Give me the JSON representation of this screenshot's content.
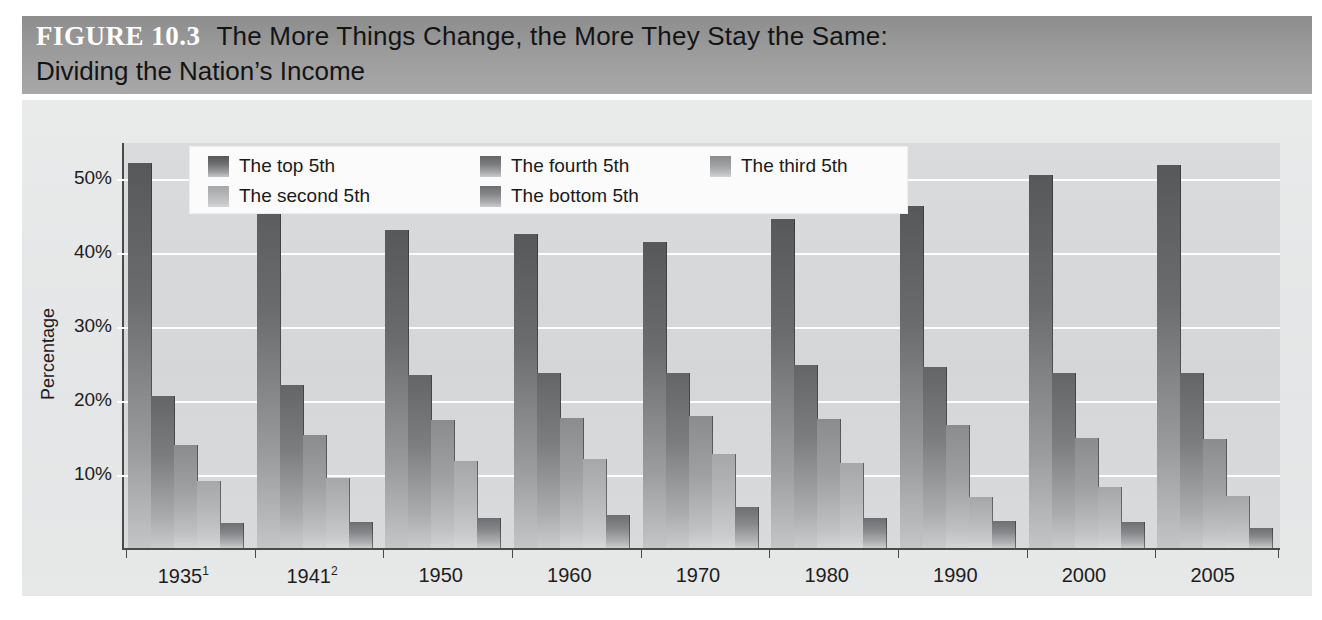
{
  "figure": {
    "number": "FIGURE 10.3",
    "title_line1": "The More Things Change, the More They Stay the Same:",
    "title_line2": "Dividing the Nation’s Income"
  },
  "chart_data": {
    "type": "bar",
    "title": "The More Things Change, the More They Stay the Same: Dividing the Nation’s Income",
    "xlabel": "",
    "ylabel": "Percentage",
    "ylim": [
      0,
      55
    ],
    "yticks": [
      10,
      20,
      30,
      40,
      50
    ],
    "ytick_labels": [
      "10%",
      "20%",
      "30%",
      "40%",
      "50%"
    ],
    "grid": true,
    "legend_position": "top-left-inside",
    "categories": [
      "1935",
      "1941",
      "1950",
      "1960",
      "1970",
      "1980",
      "1990",
      "2000",
      "2005"
    ],
    "category_labels": [
      "1935¹",
      "1941²",
      "1950",
      "1960",
      "1970",
      "1980",
      "1990",
      "2000",
      "2005"
    ],
    "category_footnotes": [
      "1",
      "2",
      "",
      "",
      "",
      "",
      "",
      "",
      ""
    ],
    "series": [
      {
        "name": "The top 5th",
        "values": [
          52.0,
          49.3,
          43.0,
          42.5,
          41.4,
          44.5,
          46.2,
          50.4,
          51.7
        ]
      },
      {
        "name": "The fourth 5th",
        "values": [
          20.5,
          22.0,
          23.4,
          23.6,
          23.6,
          24.7,
          24.4,
          23.6,
          23.7
        ]
      },
      {
        "name": "The third 5th",
        "values": [
          13.9,
          15.3,
          17.3,
          17.6,
          17.9,
          17.5,
          16.6,
          14.9,
          14.7
        ]
      },
      {
        "name": "The second 5th",
        "values": [
          9.0,
          9.5,
          11.8,
          12.0,
          12.7,
          11.5,
          6.9,
          8.3,
          7.0
        ]
      },
      {
        "name": "The bottom 5th",
        "values": [
          3.4,
          3.5,
          4.0,
          4.5,
          5.5,
          4.0,
          3.6,
          3.5,
          2.7
        ]
      }
    ]
  },
  "legend": {
    "items": [
      {
        "label": "The top 5th",
        "row": 0,
        "col": 0
      },
      {
        "label": "The fourth 5th",
        "row": 0,
        "col": 1
      },
      {
        "label": "The third 5th",
        "row": 0,
        "col": 2
      },
      {
        "label": "The second 5th",
        "row": 1,
        "col": 0
      },
      {
        "label": "The bottom 5th",
        "row": 1,
        "col": 1
      }
    ]
  },
  "colors": {
    "title_band": "#9b9b9b",
    "panel": "#e6e7e8",
    "plot": "#d6d8d9",
    "gridline": "#fdfdfd",
    "axis": "#4a4a4a",
    "text": "#1d1d1d",
    "series": [
      "#56585a",
      "#636567",
      "#8a8c8e",
      "#a5a7a9",
      "#6d6f71"
    ]
  }
}
